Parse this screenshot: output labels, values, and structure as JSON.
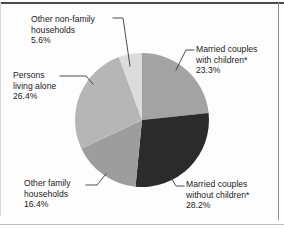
{
  "chart_data": {
    "type": "pie",
    "title": "",
    "xlabel": "",
    "ylabel": "",
    "legend_position": "none",
    "labels_position": "outside-with-leader-lines",
    "start_angle_deg": 0,
    "direction": "clockwise",
    "categories": [
      "Married couples with children*",
      "Married couples without children*",
      "Other family households",
      "Persons living alone",
      "Other non-family households"
    ],
    "values": [
      23.3,
      28.2,
      16.4,
      26.4,
      5.6
    ],
    "value_suffix": "%",
    "total": 99.9,
    "slices": [
      {
        "name": "married-with-children",
        "label_line1": "Married couples",
        "label_line2": "with children*",
        "percent": "23.3%",
        "value": 23.3,
        "color": "#a3a3a3",
        "start_deg": 0,
        "end_deg": 83.88
      },
      {
        "name": "married-without-children",
        "label_line1": "Married couples",
        "label_line2": "without children*",
        "percent": "28.2%",
        "value": 28.2,
        "color": "#2b2b2b",
        "start_deg": 83.88,
        "end_deg": 185.4
      },
      {
        "name": "other-family-households",
        "label_line1": "Other family",
        "label_line2": "households",
        "percent": "16.4%",
        "value": 16.4,
        "color": "#9d9d9d",
        "start_deg": 185.4,
        "end_deg": 244.44
      },
      {
        "name": "persons-living-alone",
        "label_line1": "Persons",
        "label_line2": "living alone",
        "percent": "26.4%",
        "value": 26.4,
        "color": "#b6b6b6",
        "start_deg": 244.44,
        "end_deg": 339.48
      },
      {
        "name": "other-non-family-households",
        "label_line1": "Other non-family",
        "label_line2": "households",
        "percent": "5.6%",
        "value": 5.6,
        "color": "#dcdcdc",
        "start_deg": 339.48,
        "end_deg": 359.64
      }
    ],
    "colors": {
      "married_with_children": "#a3a3a3",
      "married_without_children": "#2b2b2b",
      "other_family_households": "#9d9d9d",
      "persons_living_alone": "#b6b6b6",
      "other_non_family_households": "#dcdcdc",
      "leader_line": "#3a3a3a",
      "text": "#1c1c1c",
      "background": "#fdfdfd"
    }
  }
}
